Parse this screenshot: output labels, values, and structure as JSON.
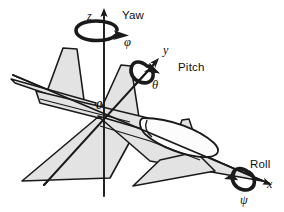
{
  "figure": {
    "background_color": "#ffffff",
    "line_color": "#1a1a1a",
    "body_fill": "#e3e3e3",
    "nose_fill": "#fcfcfc"
  },
  "axes": [
    {
      "id": "z",
      "label": "z",
      "direction": "up",
      "rotation_name": "Yaw",
      "rotation_symbol": "φ"
    },
    {
      "id": "y",
      "label": "y",
      "direction": "upper-right",
      "rotation_name": "Pitch",
      "rotation_symbol": "θ"
    },
    {
      "id": "x",
      "label": "x",
      "direction": "lower-right",
      "rotation_name": "Roll",
      "rotation_symbol": "ψ"
    }
  ],
  "origin": {
    "label": "0"
  },
  "labels": {
    "yaw": "Yaw",
    "pitch": "Pitch",
    "roll": "Roll",
    "axis_z": "z",
    "axis_y": "y",
    "axis_x": "x",
    "phi": "φ",
    "theta": "θ",
    "psi": "ψ",
    "origin": "0"
  }
}
